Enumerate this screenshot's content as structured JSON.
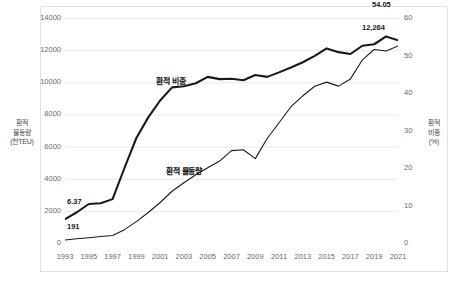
{
  "chart_data": {
    "type": "line",
    "title": "",
    "xlabel": "",
    "ylabel": "환적 물동량 (천TEU)",
    "y2label": "환적 비중 (%)",
    "grid": true,
    "legend": "inline-series-labels",
    "x": [
      1993,
      1994,
      1995,
      1996,
      1997,
      1998,
      1999,
      2000,
      2001,
      2002,
      2003,
      2004,
      2005,
      2006,
      2007,
      2008,
      2009,
      2010,
      2011,
      2012,
      2013,
      2014,
      2015,
      2016,
      2017,
      2018,
      2019,
      2020,
      2021
    ],
    "xtick_labels": [
      "1993",
      "1995",
      "1997",
      "1999",
      "2001",
      "2003",
      "2005",
      "2007",
      "2009",
      "2011",
      "2013",
      "2015",
      "2017",
      "2019",
      "2021"
    ],
    "ylim": [
      0,
      14000
    ],
    "ytick_labels": [
      "0",
      "2000",
      "4000",
      "6000",
      "8000",
      "10000",
      "12000",
      "14000"
    ],
    "y2lim": [
      0,
      60
    ],
    "y2tick_labels": [
      "0",
      "10",
      "20",
      "30",
      "40",
      "50",
      "60"
    ],
    "series": [
      {
        "name": "환적 비중",
        "axis": "right",
        "unit": "%",
        "emphasis": "thick",
        "values": [
          6.37,
          8.2,
          10.4,
          10.6,
          11.7,
          20.0,
          28.0,
          33.5,
          38.0,
          41.5,
          41.8,
          42.6,
          44.3,
          43.7,
          43.8,
          43.4,
          44.8,
          44.3,
          45.5,
          46.8,
          48.2,
          49.9,
          51.9,
          50.9,
          50.4,
          52.6,
          53.0,
          55.1,
          54.05
        ],
        "first_label": "6.37",
        "last_label": "54.05"
      },
      {
        "name": "환적 물동량",
        "axis": "left",
        "unit": "천TEU",
        "emphasis": "thin",
        "values": [
          191,
          260,
          330,
          400,
          470,
          830,
          1330,
          1900,
          2520,
          3220,
          3750,
          4250,
          4680,
          5100,
          5750,
          5800,
          5250,
          6500,
          7480,
          8480,
          9160,
          9750,
          10010,
          9760,
          10210,
          11390,
          12040,
          11950,
          12264
        ],
        "first_label": "191",
        "last_label": "12,264"
      }
    ],
    "annotations": [
      {
        "text": "환적 비중",
        "role": "series-label"
      },
      {
        "text": "환적 물동량",
        "role": "series-label"
      },
      {
        "text": "6.37",
        "role": "endpoint-value"
      },
      {
        "text": "191",
        "role": "endpoint-value"
      },
      {
        "text": "54.05",
        "role": "endpoint-value"
      },
      {
        "text": "12,264",
        "role": "endpoint-value"
      }
    ],
    "colors": {
      "line": "#1a1a1a",
      "grid": "#e8e8e8",
      "text": "#5a5a5a"
    }
  },
  "axes": {
    "left_title_lines": [
      "환적",
      "물동량",
      "(천TEU)"
    ],
    "right_title_lines": [
      "환적",
      "비중",
      "(%)"
    ]
  }
}
